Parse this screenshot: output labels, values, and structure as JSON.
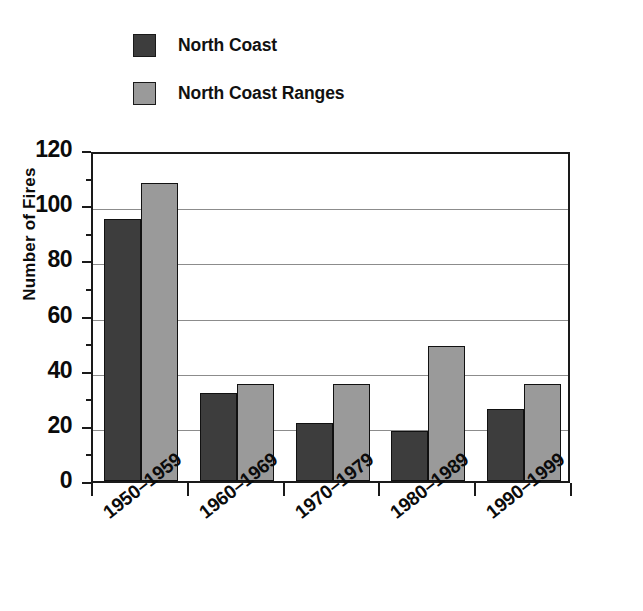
{
  "chart_data": {
    "type": "bar",
    "title": "",
    "subtitle": "",
    "xlabel": "",
    "ylabel": "Number of Fires",
    "categories": [
      "1950–1959",
      "1960–1969",
      "1970–1979",
      "1980–1989",
      "1990–1999"
    ],
    "series": [
      {
        "name": "North Coast",
        "color": "#3d3d3d",
        "values": [
          95,
          32,
          21,
          18,
          26
        ]
      },
      {
        "name": "North Coast Ranges",
        "color": "#9a9a9a",
        "values": [
          108,
          35,
          35,
          49,
          35
        ]
      }
    ],
    "ylim": [
      0,
      120
    ],
    "y_ticks": [
      0,
      20,
      40,
      60,
      80,
      100,
      120
    ],
    "y_tick_labels": [
      "0",
      "20",
      "40",
      "60",
      "80",
      "100",
      "120"
    ],
    "y_minor_tick_step": 10,
    "grid": "horizontal",
    "legend_position": "top-left",
    "bar_border_color": "#111111",
    "axis_color": "#1a1a1a",
    "gridline_color": "#8c8c8c",
    "background": "#ffffff"
  },
  "legend": {
    "items": [
      {
        "label": "North Coast",
        "color": "#3d3d3d"
      },
      {
        "label": "North Coast Ranges",
        "color": "#9a9a9a"
      }
    ]
  },
  "axes": {
    "y_title": "Number of Fires",
    "y_labels": [
      "120",
      "100",
      "80",
      "60",
      "40",
      "20",
      "0"
    ],
    "x_labels": [
      "1950–1959",
      "1960–1969",
      "1970–1979",
      "1980–1989",
      "1990–1999"
    ]
  }
}
